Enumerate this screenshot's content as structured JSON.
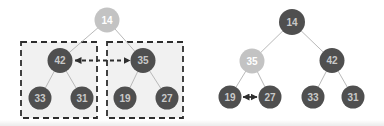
{
  "canvas": {
    "width": 384,
    "height": 126
  },
  "colors": {
    "background": "#ffffff",
    "edge": "#b9b9b9",
    "box_fill": "#f1f1f1",
    "box_border": "#2e2e2e",
    "arrow": "#2e2e2e",
    "node_dark_fill": "#4f4f4f",
    "node_dark_text": "#c9c9c9",
    "node_light_fill": "#c3c3c3",
    "node_light_text": "#ffffff"
  },
  "node_styles": {
    "dark": {
      "fill": "#4f4f4f",
      "text": "#c9c9c9"
    },
    "light": {
      "fill": "#c3c3c3",
      "text": "#ffffff"
    }
  },
  "trees": [
    {
      "name": "left-tree",
      "nodes": [
        {
          "id": "L14",
          "label": "14",
          "x": 107,
          "y": 20,
          "r": 12.5,
          "variant": "light"
        },
        {
          "id": "L42",
          "label": "42",
          "x": 60,
          "y": 60.5,
          "r": 12.5,
          "variant": "dark"
        },
        {
          "id": "L35",
          "label": "35",
          "x": 143,
          "y": 60.5,
          "r": 12.5,
          "variant": "dark"
        },
        {
          "id": "L33",
          "label": "33",
          "x": 40,
          "y": 98,
          "r": 11.5,
          "variant": "dark"
        },
        {
          "id": "L31",
          "label": "31",
          "x": 82,
          "y": 98,
          "r": 11.5,
          "variant": "dark"
        },
        {
          "id": "L19",
          "label": "19",
          "x": 125,
          "y": 98,
          "r": 11.5,
          "variant": "dark"
        },
        {
          "id": "L27",
          "label": "27",
          "x": 167,
          "y": 98,
          "r": 11.5,
          "variant": "dark"
        }
      ],
      "edges": [
        [
          "L14",
          "L42"
        ],
        [
          "L14",
          "L35"
        ],
        [
          "L42",
          "L33"
        ],
        [
          "L42",
          "L31"
        ],
        [
          "L35",
          "L19"
        ],
        [
          "L35",
          "L27"
        ]
      ],
      "boxes": [
        {
          "x": 21,
          "y": 42,
          "w": 76,
          "h": 76
        },
        {
          "x": 107,
          "y": 42,
          "w": 76,
          "h": 76
        }
      ],
      "arrows": [
        {
          "x1": 75,
          "y1": 60.5,
          "x2": 130,
          "y2": 60.5,
          "style": "dashed",
          "heads": "both"
        }
      ]
    },
    {
      "name": "right-tree",
      "nodes": [
        {
          "id": "R14",
          "label": "14",
          "x": 292,
          "y": 22,
          "r": 13,
          "variant": "dark"
        },
        {
          "id": "R35",
          "label": "35",
          "x": 252,
          "y": 61,
          "r": 12.5,
          "variant": "light"
        },
        {
          "id": "R42",
          "label": "42",
          "x": 332,
          "y": 60.5,
          "r": 12.5,
          "variant": "dark"
        },
        {
          "id": "R19",
          "label": "19",
          "x": 230,
          "y": 97,
          "r": 11.5,
          "variant": "dark"
        },
        {
          "id": "R27",
          "label": "27",
          "x": 270,
          "y": 97,
          "r": 11.5,
          "variant": "dark"
        },
        {
          "id": "R33",
          "label": "33",
          "x": 313,
          "y": 97,
          "r": 11.5,
          "variant": "dark"
        },
        {
          "id": "R31",
          "label": "31",
          "x": 353,
          "y": 97,
          "r": 11.5,
          "variant": "dark"
        }
      ],
      "edges": [
        [
          "R14",
          "R35"
        ],
        [
          "R14",
          "R42"
        ],
        [
          "R35",
          "R19"
        ],
        [
          "R35",
          "R27"
        ],
        [
          "R42",
          "R33"
        ],
        [
          "R42",
          "R31"
        ]
      ],
      "boxes": [],
      "arrows": [
        {
          "x1": 243,
          "y1": 97,
          "x2": 257,
          "y2": 97,
          "style": "solid",
          "heads": "both"
        }
      ]
    }
  ]
}
